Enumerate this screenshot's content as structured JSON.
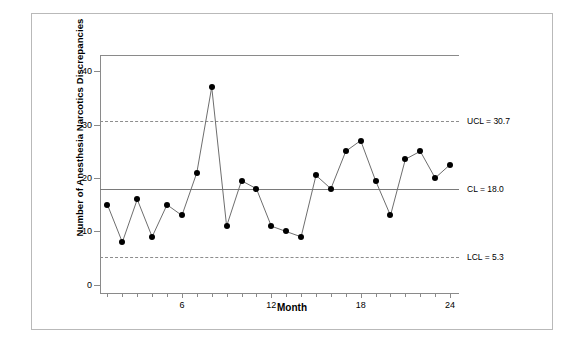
{
  "chart_data": {
    "type": "line",
    "title": "",
    "subtitle": "",
    "xlabel": "Month",
    "ylabel": "Number of Anesthesia Narcotics Discrepancies",
    "x": [
      1,
      2,
      3,
      4,
      5,
      6,
      7,
      8,
      9,
      10,
      11,
      12,
      13,
      14,
      15,
      16,
      17,
      18,
      19,
      20,
      21,
      22,
      23,
      24
    ],
    "values": [
      15,
      8,
      16,
      9,
      15,
      13,
      21,
      37,
      11,
      19.5,
      18,
      11,
      10,
      9,
      20.5,
      18,
      25,
      27,
      19.5,
      13,
      23.5,
      25,
      20,
      22.5
    ],
    "series": [
      {
        "name": "Number of Anesthesia Narcotics Discrepancies",
        "values": [
          15,
          8,
          16,
          9,
          15,
          13,
          21,
          37,
          11,
          19.5,
          18,
          11,
          10,
          9,
          20.5,
          18,
          25,
          27,
          19.5,
          13,
          23.5,
          25,
          20,
          22.5
        ]
      }
    ],
    "xlim": [
      0.5,
      24.6
    ],
    "ylim": [
      -1.5,
      43
    ],
    "xticks": [
      1,
      2,
      3,
      4,
      5,
      6,
      7,
      8,
      9,
      10,
      11,
      12,
      13,
      14,
      15,
      16,
      17,
      18,
      19,
      20,
      21,
      22,
      23,
      24
    ],
    "xticklabels": [
      "",
      "",
      "",
      "",
      "",
      "6",
      "",
      "",
      "",
      "",
      "",
      "12",
      "",
      "",
      "",
      "",
      "",
      "18",
      "",
      "",
      "",
      "",
      "",
      "24"
    ],
    "yticks": [
      0,
      10,
      20,
      30,
      40
    ],
    "yticklabels": [
      "0",
      "10",
      "20",
      "30",
      "40"
    ],
    "grid": false,
    "legend": false,
    "control_limits": {
      "ucl": {
        "value": 30.7,
        "label": "UCL = 30.7",
        "style": "dashed"
      },
      "cl": {
        "value": 18.0,
        "label": "CL = 18.0",
        "style": "solid"
      },
      "lcl": {
        "value": 5.3,
        "label": "LCL = 5.3",
        "style": "dashed"
      }
    },
    "colors": {
      "line": "#6e6e6e",
      "marker": "#000000",
      "axis": "#8a8a8a",
      "control_solid": "#7a7a7a",
      "control_dashed": "#8d8d8d",
      "background": "#ffffff",
      "frame": "#b9b9b9"
    },
    "marker": "filled-circle"
  }
}
